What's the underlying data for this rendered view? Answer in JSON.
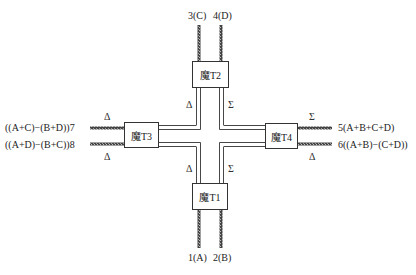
{
  "diagram": {
    "type": "magic-T cross network (four magic tees)",
    "boxes": {
      "t1": {
        "label": "魔T1"
      },
      "t2": {
        "label": "魔T2"
      },
      "t3": {
        "label": "魔T3"
      },
      "t4": {
        "label": "魔T4"
      }
    },
    "ports": {
      "p1": "1(A)",
      "p2": "2(B)",
      "p3": "3(C)",
      "p4": "4(D)",
      "p5": "5(A+B+C+D)",
      "p6": "6((A+B)−(C+D))",
      "p7": "((A+C)−(B+D))7",
      "p8": "((A+D)−(B+C))8"
    },
    "symbols": {
      "delta": "Δ",
      "sigma": "Σ"
    },
    "arm_labels": {
      "t2_left": "Δ",
      "t2_right": "Σ",
      "t1_left": "Δ",
      "t1_right": "Σ",
      "t3_top": "Δ",
      "t3_bottom": "Δ",
      "t4_top": "Σ",
      "t4_bottom": "Δ"
    }
  }
}
